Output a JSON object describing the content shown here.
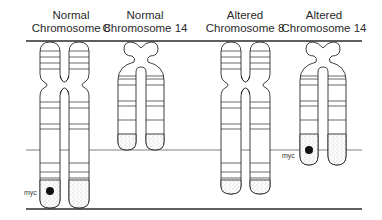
{
  "figure": {
    "columns": [
      {
        "line1": "Normal",
        "line2": "Chromosome 8"
      },
      {
        "line1": "Normal",
        "line2": "Chromosome 14"
      },
      {
        "line1": "Altered",
        "line2": "Chromosome 8"
      },
      {
        "line1": "Altered",
        "line2": "Chromosome 14"
      }
    ],
    "gene_labels": [
      {
        "text": "myc",
        "location": "Normal Chromosome 8"
      },
      {
        "text": "myc",
        "location": "Altered Chromosome 14"
      }
    ],
    "colors": {
      "stroke": "#2a2a2a",
      "background": "#ffffff",
      "stipple": "#8a8a8a"
    }
  }
}
